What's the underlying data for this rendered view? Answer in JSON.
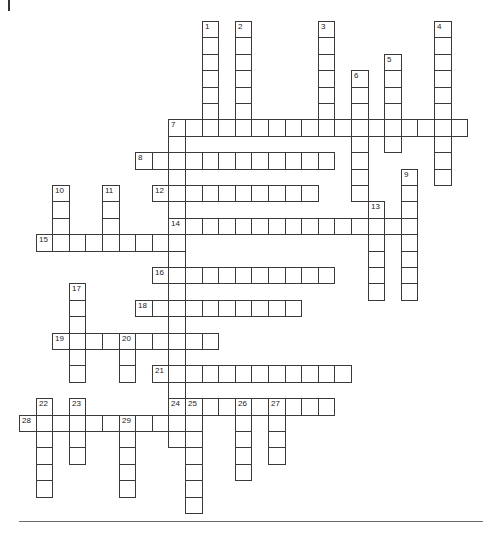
{
  "puzzle": {
    "type": "crossword",
    "grid_origin": {
      "x": 19,
      "y": 21
    },
    "cell_size": {
      "w": 16.6,
      "h": 16.4
    },
    "border_color": "#3a3a3a",
    "entries": [
      {
        "number": "1",
        "direction": "down",
        "row": 0,
        "col": 11,
        "length": 7
      },
      {
        "number": "2",
        "direction": "down",
        "row": 0,
        "col": 13,
        "length": 7
      },
      {
        "number": "3",
        "direction": "down",
        "row": 0,
        "col": 18,
        "length": 7
      },
      {
        "number": "4",
        "direction": "down",
        "row": 0,
        "col": 25,
        "length": 10
      },
      {
        "number": "5",
        "direction": "down",
        "row": 2,
        "col": 22,
        "length": 6
      },
      {
        "number": "6",
        "direction": "down",
        "row": 3,
        "col": 20,
        "length": 8
      },
      {
        "number": "7",
        "direction": "across",
        "row": 6,
        "col": 9,
        "length": 18
      },
      {
        "number": "7",
        "direction": "down",
        "row": 6,
        "col": 9,
        "length": 20
      },
      {
        "number": "8",
        "direction": "across",
        "row": 8,
        "col": 7,
        "length": 12
      },
      {
        "number": "9",
        "direction": "down",
        "row": 9,
        "col": 23,
        "length": 8
      },
      {
        "number": "10",
        "direction": "down",
        "row": 10,
        "col": 2,
        "length": 4
      },
      {
        "number": "11",
        "direction": "down",
        "row": 10,
        "col": 5,
        "length": 4
      },
      {
        "number": "12",
        "direction": "across",
        "row": 10,
        "col": 8,
        "length": 10
      },
      {
        "number": "13",
        "direction": "down",
        "row": 11,
        "col": 21,
        "length": 6
      },
      {
        "number": "14",
        "direction": "across",
        "row": 12,
        "col": 9,
        "length": 15
      },
      {
        "number": "15",
        "direction": "across",
        "row": 13,
        "col": 1,
        "length": 9
      },
      {
        "number": "16",
        "direction": "across",
        "row": 15,
        "col": 8,
        "length": 11
      },
      {
        "number": "17",
        "direction": "down",
        "row": 16,
        "col": 3,
        "length": 6
      },
      {
        "number": "18",
        "direction": "across",
        "row": 17,
        "col": 7,
        "length": 10
      },
      {
        "number": "19",
        "direction": "across",
        "row": 19,
        "col": 2,
        "length": 10
      },
      {
        "number": "20",
        "direction": "down",
        "row": 19,
        "col": 6,
        "length": 3
      },
      {
        "number": "21",
        "direction": "across",
        "row": 21,
        "col": 8,
        "length": 12
      },
      {
        "number": "22",
        "direction": "down",
        "row": 23,
        "col": 1,
        "length": 6
      },
      {
        "number": "23",
        "direction": "down",
        "row": 23,
        "col": 3,
        "length": 4
      },
      {
        "number": "24",
        "direction": "across",
        "row": 23,
        "col": 9,
        "length": 10
      },
      {
        "number": "25",
        "direction": "down",
        "row": 23,
        "col": 10,
        "length": 7
      },
      {
        "number": "26",
        "direction": "down",
        "row": 23,
        "col": 13,
        "length": 5
      },
      {
        "number": "27",
        "direction": "down",
        "row": 23,
        "col": 15,
        "length": 4
      },
      {
        "number": "28",
        "direction": "across",
        "row": 24,
        "col": 0,
        "length": 10
      },
      {
        "number": "29",
        "direction": "down",
        "row": 24,
        "col": 6,
        "length": 5
      }
    ]
  }
}
